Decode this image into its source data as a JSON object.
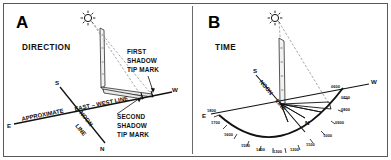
{
  "figure": {
    "panel_count": 2,
    "background_color": "#ffffff",
    "border_color": "#5a5a5a",
    "ink_color": "#111111"
  },
  "panel_a": {
    "letter": "A",
    "subtitle": "DIRECTION",
    "icons": {
      "sun": "sun-icon",
      "gnomon": "stick-icon"
    },
    "callouts": {
      "first_mark_line1": "FIRST",
      "first_mark_line2": "SHADOW",
      "first_mark_line3": "TIP MARK",
      "second_mark_line1": "SECOND",
      "second_mark_line2": "SHADOW",
      "second_mark_line3": "TIP MARK"
    },
    "line_labels": {
      "approximate": "APPROXIMATE",
      "east_west": "EAST – WEST LINE",
      "noon": "NOON",
      "line": "LINE"
    },
    "compass": {
      "east": "E",
      "west": "W",
      "north": "N",
      "south": "S"
    }
  },
  "panel_b": {
    "letter": "B",
    "subtitle": "TIME",
    "icons": {
      "sun": "sun-icon",
      "gnomon": "stick-icon"
    },
    "line_labels": {
      "noon": "NOON",
      "line": "LINE"
    },
    "compass": {
      "east": "E",
      "west": "W",
      "north": "N",
      "south": "S"
    },
    "time_arc": {
      "labels": [
        "0600",
        "0700",
        "0800",
        "0900",
        "1000",
        "1100",
        "1200",
        "1300",
        "1400",
        "1500",
        "1600",
        "1700",
        "1800"
      ],
      "tick_count": 13
    }
  }
}
